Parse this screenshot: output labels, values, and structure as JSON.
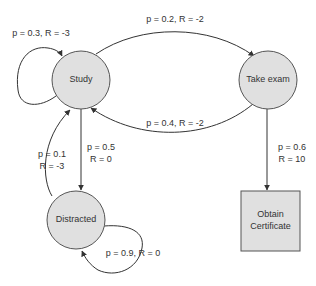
{
  "diagram": {
    "type": "markov-decision-process",
    "colors": {
      "node_fill": "#e0e0e0",
      "node_stroke": "#555555",
      "edge_stroke": "#333333",
      "text": "#333333",
      "background": "#ffffff"
    },
    "nodes": {
      "study": {
        "label": "Study",
        "shape": "circle"
      },
      "take_exam": {
        "label": "Take exam",
        "shape": "circle"
      },
      "distracted": {
        "label": "Distracted",
        "shape": "circle"
      },
      "obtain_certificate": {
        "label_line1": "Obtain",
        "label_line2": "Certificate",
        "shape": "square"
      }
    },
    "edges": {
      "study_self": {
        "from": "Study",
        "to": "Study",
        "label": "p = 0.3, R = -3"
      },
      "study_to_exam": {
        "from": "Study",
        "to": "Take exam",
        "label": "p = 0.2, R = -2"
      },
      "exam_to_study": {
        "from": "Take exam",
        "to": "Study",
        "label": "p = 0.4, R = -2"
      },
      "study_to_distracted": {
        "from": "Study",
        "to": "Distracted",
        "label_line1": "p = 0.5",
        "label_line2": "R = 0"
      },
      "distracted_to_study": {
        "from": "Distracted",
        "to": "Study",
        "label_line1": "p = 0.1",
        "label_line2": "R = -3"
      },
      "distracted_self": {
        "from": "Distracted",
        "to": "Distracted",
        "label": "p = 0.9, R = 0"
      },
      "exam_to_certificate": {
        "from": "Take exam",
        "to": "Obtain Certificate",
        "label_line1": "p = 0.6",
        "label_line2": "R = 10"
      }
    }
  }
}
